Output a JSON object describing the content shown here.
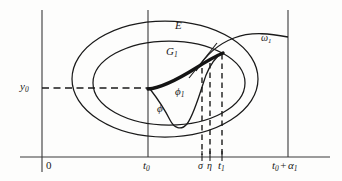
{
  "figure": {
    "background_color": "#fdfdfc",
    "line_color": "#1a1a1a"
  },
  "axes": {
    "horizontal_axis_name": "t-axis",
    "vertical_axis_name": "y-axis",
    "origin_label": "0",
    "y_value_label": "y",
    "y_value_sub": "0",
    "t0_label": "t",
    "t0_sub": "0",
    "t_end_label": "t",
    "t_end_sub": "0",
    "t_end_op": " + ",
    "t_end_second": "α",
    "t_end_second_sub": "1"
  },
  "tick_labels": [
    {
      "name": "sigma",
      "text": "σ",
      "sub": ""
    },
    {
      "name": "eta",
      "text": "η",
      "sub": ""
    },
    {
      "name": "t1",
      "text": "t",
      "sub": "1"
    }
  ],
  "curve_labels": [
    {
      "name": "region-E",
      "text": "E",
      "sub": ""
    },
    {
      "name": "region-G1",
      "text": "G",
      "sub": "1"
    },
    {
      "name": "omega1",
      "text": "ω",
      "sub": "1"
    },
    {
      "name": "phi1",
      "text": "ϕ",
      "sub": "1"
    },
    {
      "name": "phi",
      "text": "ϕ",
      "sub": ""
    }
  ],
  "labels": {
    "origin": "0",
    "y0_base": "y",
    "y0_sub": "0",
    "t0_base": "t",
    "t0_sub": "0",
    "sigma": "σ",
    "eta": "η",
    "t1_base": "t",
    "t1_sub": "1",
    "tend_base": "t",
    "tend_sub": "0",
    "tend_plus": "+",
    "tend_alpha": "α",
    "tend_alpha_sub": "1",
    "E": "E",
    "G_base": "G",
    "G_sub": "1",
    "omega_base": "ω",
    "omega_sub": "1",
    "phi1_base": "ϕ",
    "phi1_sub": "1",
    "phi": "ϕ"
  },
  "geometry": {
    "t_axis_y": 157,
    "y_axis_x": 42,
    "t0_x": 148,
    "t_end_x": 288,
    "y0_y": 88,
    "sigma_x": 202,
    "eta_x": 210,
    "t1_x": 222,
    "outer_ellipse": {
      "cx": 165,
      "cy": 79,
      "rx": 93,
      "ry": 58
    },
    "inner_ellipse": {
      "cx": 169,
      "cy": 83,
      "rx": 76,
      "ry": 42
    }
  }
}
